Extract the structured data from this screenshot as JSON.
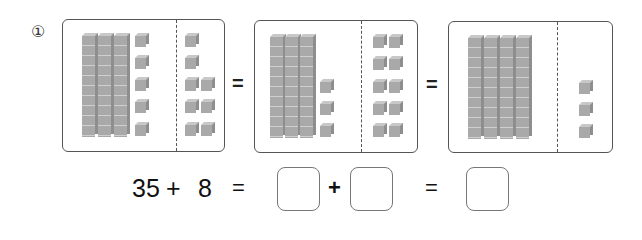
{
  "problem": {
    "number_label": "①",
    "panels": [
      {
        "tens_rods": 3,
        "left_units": 5,
        "right_units": 8
      },
      {
        "tens_rods": 3,
        "left_units": 3,
        "right_units": 10
      },
      {
        "tens_rods": 4,
        "left_units": 0,
        "right_units": 3
      }
    ],
    "panel_equals": [
      "=",
      "="
    ],
    "equation": {
      "addend1": "35",
      "plus1": "+",
      "addend2": "8",
      "equals1": "=",
      "blank1": "",
      "plus2": "+",
      "blank2": "",
      "equals2": "=",
      "blank3": ""
    }
  }
}
